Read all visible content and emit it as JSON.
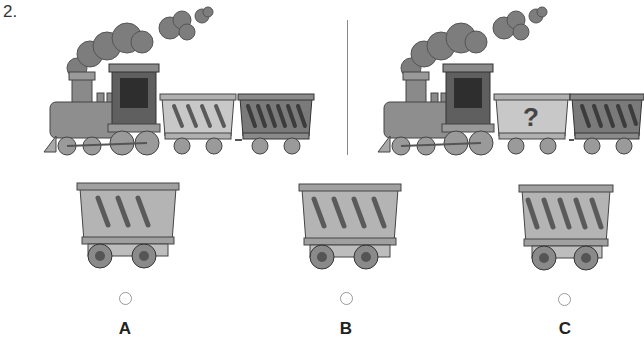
{
  "question": {
    "number": "2."
  },
  "pattern": {
    "left_train": {
      "wagons": [
        {
          "sticks": 4,
          "shade": "light"
        },
        {
          "sticks": 6,
          "shade": "dark"
        }
      ]
    },
    "right_train": {
      "wagons": [
        {
          "sticks": null,
          "shade": "light",
          "label": "?"
        },
        {
          "sticks": 5,
          "shade": "dark"
        }
      ]
    }
  },
  "options": [
    {
      "label": "A",
      "sticks": 3
    },
    {
      "label": "B",
      "sticks": 4
    },
    {
      "label": "C",
      "sticks": 5
    }
  ],
  "colors": {
    "wagon_light": "#c8c8c8",
    "wagon_dark": "#7a7a7a",
    "wagon_option": "#b4b4b4",
    "stick": "#5a5a5a",
    "smoke": "#7d7d7d",
    "engine": "#8a8a8a",
    "wheel": "#9a9a9a"
  }
}
